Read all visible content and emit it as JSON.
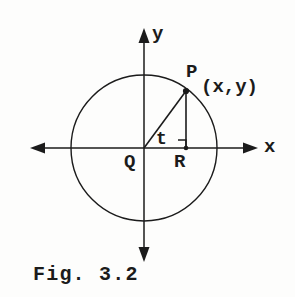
{
  "figure": {
    "caption": "Fig. 3.2",
    "kind": "geometry-diagram",
    "ink_color": "#1b1b1b",
    "background_color": "#fdfdfc"
  },
  "axes": {
    "x_axis_label": "x",
    "y_axis_label": "y",
    "origin_label": "Q",
    "x_axis": {
      "start_px": [
        30,
        148
      ],
      "end_px": [
        258,
        148
      ],
      "arrows": "both"
    },
    "y_axis": {
      "start_px": [
        144,
        28
      ],
      "end_px": [
        144,
        262
      ],
      "arrows": "both"
    }
  },
  "circle": {
    "center_px": [
      144,
      148
    ],
    "radius_px": 73,
    "stroke_width": 1.4
  },
  "points": [
    {
      "name": "Q",
      "label": "Q",
      "role": "origin",
      "px": [
        144,
        148
      ],
      "dot": false
    },
    {
      "name": "P",
      "label": "P",
      "role": "point-on-circle",
      "px": [
        186,
        91
      ],
      "dot": true
    },
    {
      "name": "R",
      "label": "R",
      "role": "foot-of-perpendicular",
      "px": [
        186,
        148
      ],
      "dot": true
    }
  ],
  "segments": [
    {
      "name": "radius-QP",
      "from": [
        144,
        148
      ],
      "to": [
        186,
        91
      ]
    },
    {
      "name": "perpendicular-PR",
      "from": [
        186,
        91
      ],
      "to": [
        186,
        148
      ]
    }
  ],
  "annotations": {
    "angle_label": "t",
    "angle_vertex": "Q",
    "coordinate_label": "(x,y)",
    "coordinate_of": "P",
    "right_angle_at": "R",
    "right_angle_marker_px": [
      178,
      140
    ],
    "right_angle_marker_size_px": 8
  }
}
